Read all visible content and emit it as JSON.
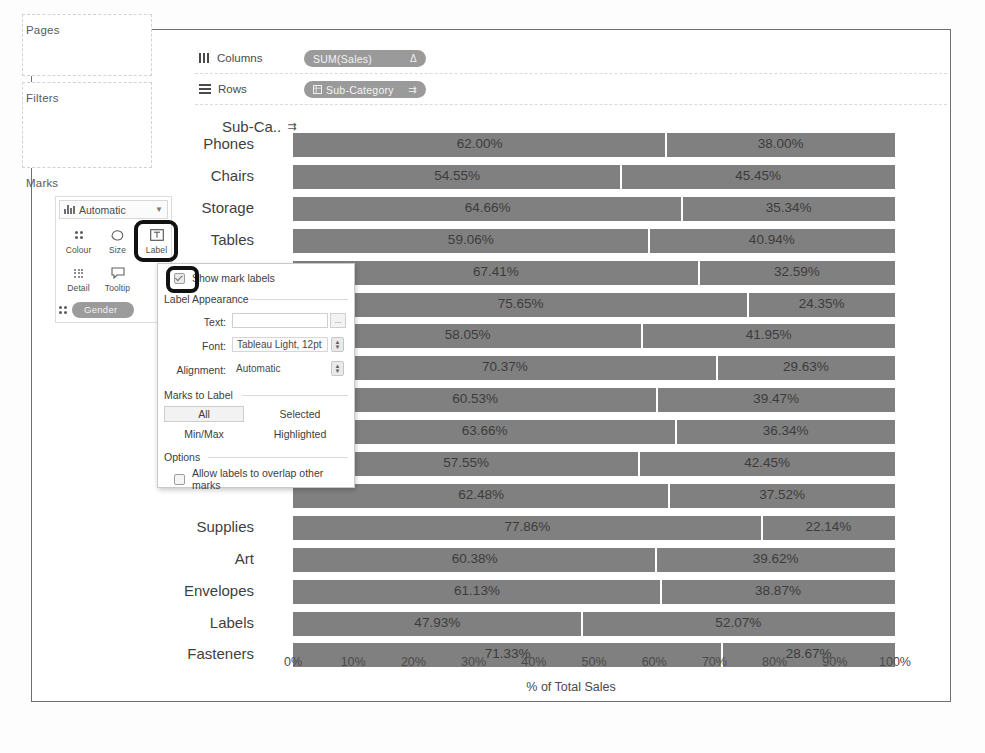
{
  "shelves": {
    "pages_label": "Pages",
    "filters_label": "Filters",
    "marks_label": "Marks",
    "columns_label": "Columns",
    "rows_label": "Rows",
    "columns_pill": "SUM(Sales)",
    "columns_pill_tail": "Δ",
    "rows_pill": "Sub-Category",
    "rows_pill_tail": "⇉"
  },
  "marks_card": {
    "type_value": "Automatic",
    "buttons": [
      {
        "label": "Colour",
        "icon": "colour-dots-icon"
      },
      {
        "label": "Size",
        "icon": "size-shape-icon"
      },
      {
        "label": "Label",
        "icon": "label-box-icon"
      },
      {
        "label": "Detail",
        "icon": "detail-dots-icon"
      },
      {
        "label": "Tooltip",
        "icon": "tooltip-bubble-icon"
      }
    ],
    "pill": "Gender"
  },
  "dialog": {
    "show_mark_labels": "Show mark labels",
    "show_mark_labels_checked": true,
    "label_appearance": "Label Appearance",
    "text_label": "Text:",
    "text_value": "",
    "text_button": "...",
    "font_label": "Font:",
    "font_value": "Tableau Light, 12pt",
    "alignment_label": "Alignment:",
    "alignment_value": "Automatic",
    "marks_to_label": "Marks to Label",
    "marks_options": [
      "All",
      "Selected",
      "Min/Max",
      "Highlighted"
    ],
    "marks_selected": "All",
    "options_label": "Options",
    "allow_overlap": "Allow labels to overlap other marks",
    "allow_overlap_checked": false
  },
  "chart_data": {
    "type": "bar",
    "title": "",
    "row_header": "Sub-Ca..",
    "xlabel": "% of Total Sales",
    "ylabel": "",
    "xlim": [
      0,
      100
    ],
    "xticks": [
      "0%",
      "10%",
      "20%",
      "30%",
      "40%",
      "50%",
      "60%",
      "70%",
      "80%",
      "90%",
      "100%"
    ],
    "grid": false,
    "legend": "",
    "stacked": true,
    "bar_color": "#808080",
    "categories": [
      "Phones",
      "Chairs",
      "Storage",
      "Tables",
      "Binders",
      "Machines",
      "Accessories",
      "Copiers",
      "Bookcases",
      "Appliances",
      "Furnishings",
      "Paper",
      "Supplies",
      "Art",
      "Envelopes",
      "Labels",
      "Fasteners"
    ],
    "categories_visible": [
      "Phones",
      "Chairs",
      "Storage",
      "Tables",
      "",
      "",
      "",
      "",
      "",
      "",
      "",
      "",
      "Supplies",
      "Art",
      "Envelopes",
      "Labels",
      "Fasteners"
    ],
    "series": [
      {
        "name": "Segment A",
        "values": [
          62.0,
          54.55,
          64.66,
          59.06,
          67.41,
          75.65,
          58.05,
          70.37,
          60.53,
          63.66,
          57.55,
          62.48,
          77.86,
          60.38,
          61.13,
          47.93,
          71.33
        ]
      },
      {
        "name": "Segment B",
        "values": [
          38.0,
          45.45,
          35.34,
          40.94,
          32.59,
          24.35,
          41.95,
          29.63,
          39.47,
          36.34,
          42.45,
          37.52,
          22.14,
          39.62,
          38.87,
          52.07,
          28.67
        ]
      }
    ],
    "labels_left": [
      "62.00%",
      "54.55%",
      "64.66%",
      "59.06%",
      "67.41%",
      "75.65%",
      "58.05%",
      "70.37%",
      "60.53%",
      "63.66%",
      "57.55%",
      "62.48%",
      "77.86%",
      "60.38%",
      "61.13%",
      "47.93%",
      "71.33%"
    ],
    "labels_right": [
      "38.00%",
      "45.45%",
      "35.34%",
      "40.94%",
      "32.59%",
      "24.35%",
      "41.95%",
      "29.63%",
      "39.47%",
      "36.34%",
      "42.45%",
      "37.52%",
      "22.14%",
      "39.62%",
      "38.87%",
      "52.07%",
      "28.67%"
    ]
  }
}
